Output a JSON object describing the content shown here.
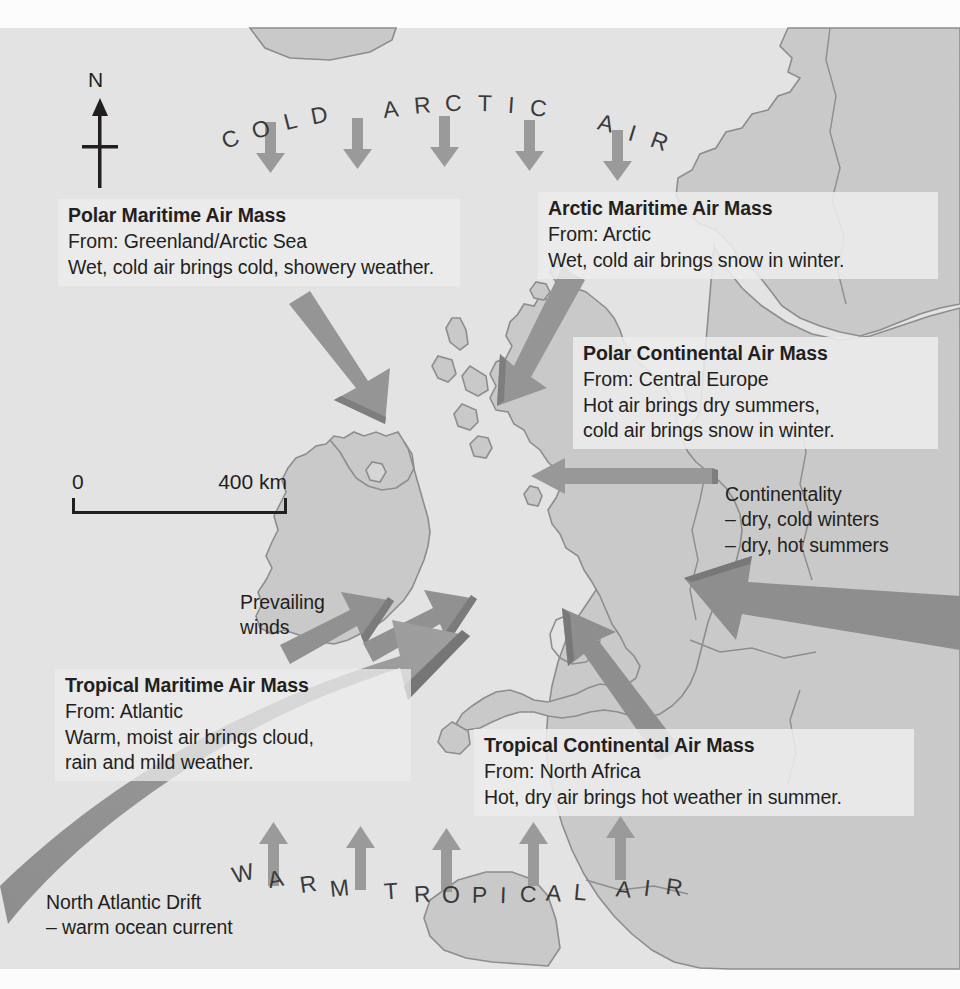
{
  "map": {
    "title": "UK Air Masses Map",
    "colors": {
      "sea": "#e6e6e6",
      "land": "#c8c8c8",
      "land_outline": "#8f8f8f",
      "arrow_dark": "#8a8a8a",
      "arrow_mid": "#9b9b9b",
      "arrow_light": "#b4b4b4",
      "text": "#231f20",
      "box_bg": "#ececec"
    }
  },
  "compass": {
    "north_label": "N"
  },
  "scale_bar": {
    "start": "0",
    "end": "400 km"
  },
  "air_flow_labels": {
    "top": "COLD  ARCTIC  AIR",
    "top_letters": [
      "C",
      "O",
      "L",
      "D",
      "A",
      "R",
      "C",
      "T",
      "I",
      "C",
      "A",
      "I",
      "R"
    ],
    "bottom": "WARM  TROPICAL  AIR",
    "bottom_letters": [
      "W",
      "A",
      "R",
      "M",
      "T",
      "R",
      "O",
      "P",
      "I",
      "C",
      "A",
      "L",
      "A",
      "I",
      "R"
    ]
  },
  "annotations": [
    {
      "id": "polar-maritime",
      "title": "Polar Maritime Air Mass",
      "lines": [
        "From: Greenland/Arctic Sea",
        "Wet, cold air brings cold, showery weather."
      ]
    },
    {
      "id": "arctic-maritime",
      "title": "Arctic Maritime Air Mass",
      "lines": [
        "From: Arctic",
        "Wet, cold air brings snow in winter."
      ]
    },
    {
      "id": "polar-continental",
      "title": "Polar Continental Air Mass",
      "lines": [
        "From: Central Europe",
        "Hot air brings dry summers,",
        "cold air brings snow in winter."
      ]
    },
    {
      "id": "tropical-maritime",
      "title": "Tropical Maritime Air Mass",
      "lines": [
        "From: Atlantic",
        "Warm, moist air brings cloud,",
        "rain and mild weather."
      ]
    },
    {
      "id": "tropical-continental",
      "title": "Tropical Continental Air Mass",
      "lines": [
        "From: North Africa",
        "Hot, dry air brings hot weather in summer."
      ]
    }
  ],
  "plain_labels": {
    "continentality": [
      "Continentality",
      "– dry, cold winters",
      "– dry, hot summers"
    ],
    "prevailing_winds": [
      "Prevailing",
      "winds"
    ],
    "north_atlantic_drift": [
      "North Atlantic Drift",
      "– warm ocean current"
    ]
  }
}
